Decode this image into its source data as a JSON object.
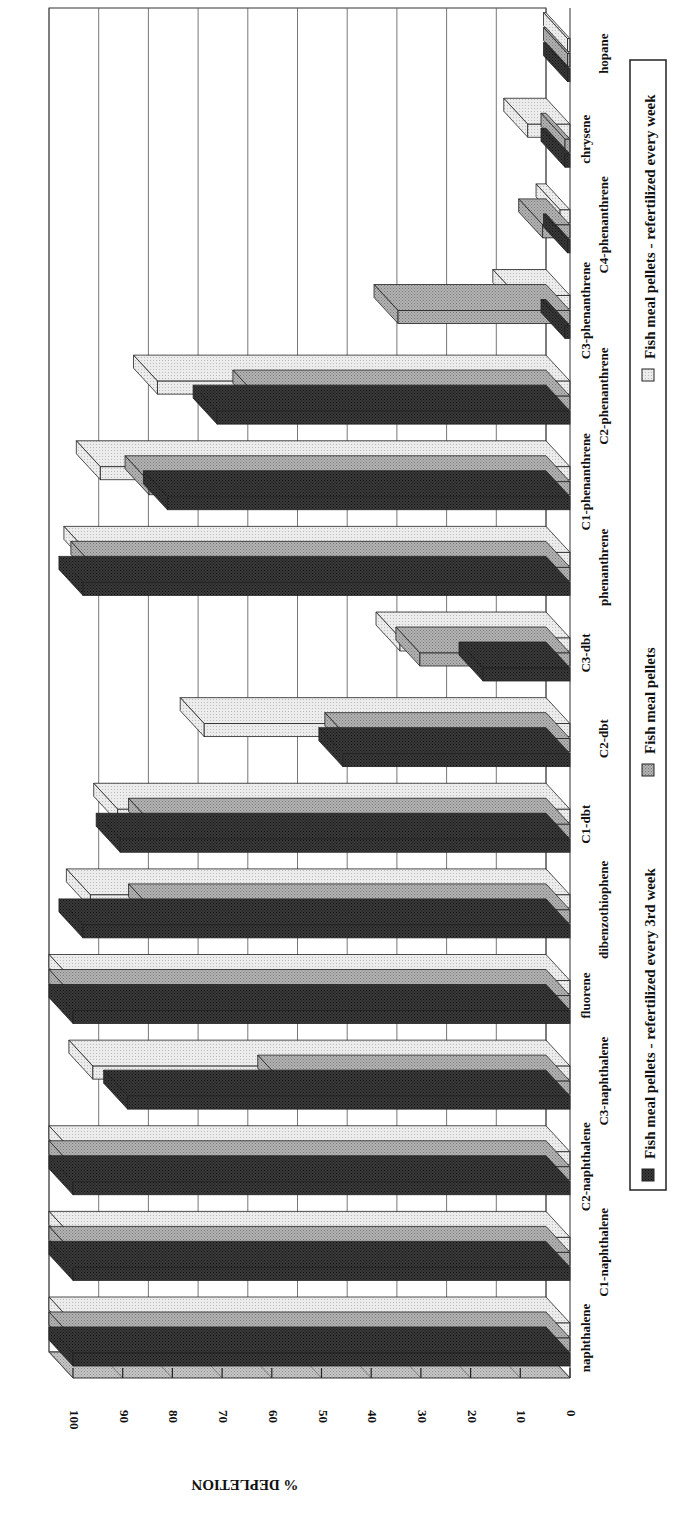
{
  "chart_data": {
    "type": "bar",
    "orientation": "3d-clustered-bar, page rotated 90 degrees",
    "title": "",
    "ylabel": "% DEPLETION",
    "xlabel": "",
    "ylim": [
      0,
      100
    ],
    "yticks": [
      0,
      10,
      20,
      30,
      40,
      50,
      60,
      70,
      80,
      90,
      100
    ],
    "grid": true,
    "legend_position": "bottom",
    "categories": [
      "naphthalene",
      "C1-naphthalene",
      "C2-naphthalene",
      "C3-naphthalene",
      "fluorene",
      "dibenzothiophene",
      "C1-dbt",
      "C2-dbt",
      "C3-dbt",
      "phenanthrene",
      "C1-phenanthrene",
      "C2-phenanthrene",
      "C3-phenanthrene",
      "C4-phenanthrene",
      "chrysene",
      "hopane"
    ],
    "series": [
      {
        "name": "Fish meal pellets - refertilized every 3rd week",
        "color": "#2a2a2a",
        "values": [
          100,
          100,
          100,
          89,
          100,
          98,
          90.5,
          45.7,
          17.5,
          98,
          81,
          71,
          1,
          0.5,
          1,
          0.5
        ]
      },
      {
        "name": "Fish meal pellets",
        "color": "#a8a8a8",
        "values": [
          100,
          100,
          100,
          58,
          100,
          84,
          84,
          44.5,
          30.2,
          95.6,
          84.7,
          63,
          34.6,
          5.5,
          1,
          0.5
        ]
      },
      {
        "name": "Fish meal pellets - refertilized every week",
        "color": "#e6e6e6",
        "values": [
          100,
          100,
          100,
          96,
          100,
          96.5,
          91,
          73.6,
          34.2,
          97,
          94.5,
          83,
          10.7,
          2,
          8.5,
          0.5
        ]
      }
    ]
  },
  "axis": {
    "label": "% DEPLETION",
    "ticks": [
      "0",
      "10",
      "20",
      "30",
      "40",
      "50",
      "60",
      "70",
      "80",
      "90",
      "100"
    ]
  },
  "legend": {
    "items": [
      {
        "label": "Fish meal pellets - refertilized every 3rd week",
        "color": "#2a2a2a"
      },
      {
        "label": "Fish meal pellets",
        "color": "#a8a8a8"
      },
      {
        "label": "Fish meal pellets - refertilized every week",
        "color": "#e6e6e6"
      }
    ]
  }
}
